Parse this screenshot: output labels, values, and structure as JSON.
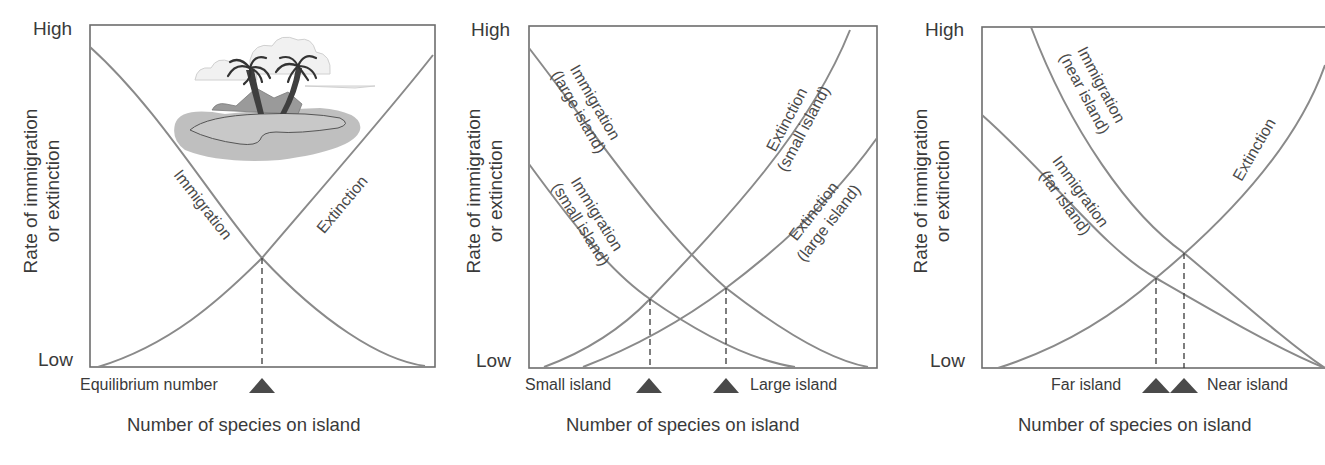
{
  "figure": {
    "colors": {
      "curve": "#8a8a8a",
      "frame": "#6d6d6d",
      "text": "#3a3a3a",
      "marker": "#4a4a4a"
    },
    "panels": [
      {
        "id": "a",
        "y_high": "High",
        "y_low": "Low",
        "y_axis_line1": "Rate of immigration",
        "y_axis_line2": "or extinction",
        "x_axis_title": "Number of species on island",
        "curves": [
          {
            "label": "Immigration",
            "type": "decreasing"
          },
          {
            "label": "Extinction",
            "type": "increasing"
          }
        ],
        "markers": [
          {
            "label": "Equilibrium number",
            "label_side": "left"
          }
        ],
        "illustration": "tropical-island-with-palm-trees"
      },
      {
        "id": "b",
        "y_high": "High",
        "y_low": "Low",
        "y_axis_line1": "Rate of immigration",
        "y_axis_line2": "or extinction",
        "x_axis_title": "Number of species on island",
        "curves": [
          {
            "label_line1": "Immigration",
            "label_line2": "(large island)",
            "type": "decreasing"
          },
          {
            "label_line1": "Immigration",
            "label_line2": "(small island)",
            "type": "decreasing"
          },
          {
            "label_line1": "Extinction",
            "label_line2": "(small island)",
            "type": "increasing"
          },
          {
            "label_line1": "Extinction",
            "label_line2": "(large island)",
            "type": "increasing"
          }
        ],
        "markers": [
          {
            "label": "Small island",
            "label_side": "left"
          },
          {
            "label": "Large island",
            "label_side": "right"
          }
        ]
      },
      {
        "id": "c",
        "y_high": "High",
        "y_low": "Low",
        "y_axis_line1": "Rate of immigration",
        "y_axis_line2": "or extinction",
        "x_axis_title": "Number of species on island",
        "curves": [
          {
            "label_line1": "Immigration",
            "label_line2": "(near island)",
            "type": "decreasing"
          },
          {
            "label_line1": "Immigration",
            "label_line2": "(far island)",
            "type": "decreasing"
          },
          {
            "label": "Extinction",
            "type": "increasing"
          }
        ],
        "markers": [
          {
            "label": "Far island",
            "label_side": "left"
          },
          {
            "label": "Near island",
            "label_side": "right"
          }
        ]
      }
    ]
  }
}
